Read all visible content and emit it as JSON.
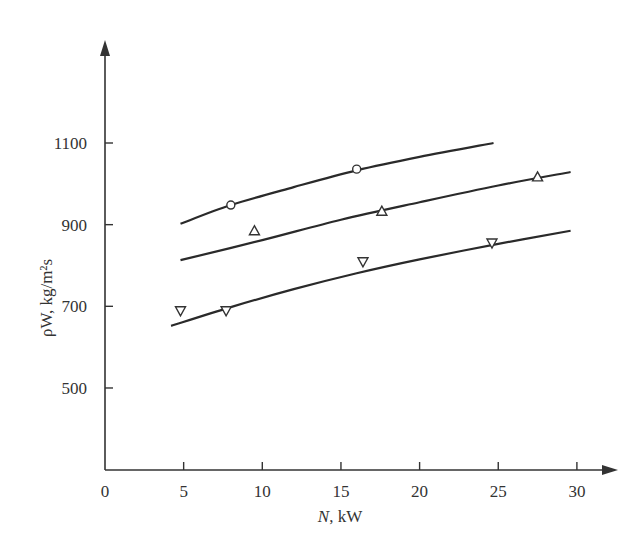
{
  "chart_data": {
    "type": "scatter",
    "title": "",
    "xlabel": "N, kW",
    "ylabel": "ρW, kg/m²s",
    "xlim": [
      0,
      32
    ],
    "ylim": [
      300,
      1250
    ],
    "xticks": [
      0,
      5,
      10,
      15,
      20,
      25,
      30
    ],
    "yticks": [
      500,
      700,
      900,
      1100
    ],
    "grid": false,
    "legend": null,
    "series": [
      {
        "name": "circles",
        "marker": "circle",
        "points": [
          [
            8,
            948
          ],
          [
            16,
            1036
          ]
        ],
        "curve": [
          [
            4.8,
            902
          ],
          [
            8,
            948
          ],
          [
            12,
            992
          ],
          [
            16,
            1033
          ],
          [
            20,
            1066
          ],
          [
            24.7,
            1100
          ]
        ]
      },
      {
        "name": "triangles-up",
        "marker": "triangle-up",
        "points": [
          [
            9.5,
            885
          ],
          [
            17.6,
            933
          ],
          [
            27.5,
            1017
          ]
        ],
        "curve": [
          [
            4.8,
            813
          ],
          [
            10,
            862
          ],
          [
            15,
            912
          ],
          [
            20,
            955
          ],
          [
            25,
            996
          ],
          [
            29.6,
            1029
          ]
        ]
      },
      {
        "name": "triangles-down",
        "marker": "triangle-down",
        "points": [
          [
            4.8,
            689
          ],
          [
            7.7,
            689
          ],
          [
            16.4,
            809
          ],
          [
            24.6,
            855
          ]
        ],
        "curve": [
          [
            4.2,
            652
          ],
          [
            8,
            698
          ],
          [
            12,
            742
          ],
          [
            16,
            781
          ],
          [
            20,
            815
          ],
          [
            25,
            853
          ],
          [
            29.6,
            885
          ]
        ]
      }
    ]
  },
  "axes": {
    "x_label_main": "N",
    "x_label_unit": ", kW",
    "y_label": "ρW, kg/m²s",
    "x_ticks": [
      "0",
      "5",
      "10",
      "15",
      "20",
      "25",
      "30"
    ],
    "y_ticks": [
      "500",
      "700",
      "900",
      "1100"
    ]
  }
}
